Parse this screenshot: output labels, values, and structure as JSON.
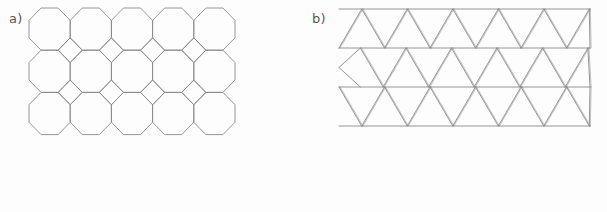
{
  "figure": {
    "background_color": "#fdfdfd",
    "stroke_color": "#8a8a8c",
    "stroke_width": 0.9,
    "width": 607,
    "height": 212
  },
  "panels": [
    {
      "id": "panel-a",
      "label": "a)",
      "label_position": {
        "x": 9,
        "y": 12
      },
      "tiling_name": "truncated square tiling",
      "tile_shapes": [
        "octagon",
        "square"
      ],
      "grid": {
        "columns": 5,
        "rows": 3,
        "pitch_x": 41.2,
        "pitch_y": 42.2,
        "origin_x": 29,
        "origin_y": 8
      },
      "bounds": {
        "x": 29,
        "y": 8,
        "width": 206,
        "height": 127
      },
      "octagon": {
        "side_fraction": 0.4142,
        "count": 15
      },
      "square_gaps": {
        "count": 8,
        "orientation": "diamond"
      }
    },
    {
      "id": "panel-b",
      "label": "b)",
      "label_position": {
        "x": 312,
        "y": 12
      },
      "tiling_name": "triangular tiling",
      "tile_shapes": [
        "triangle"
      ],
      "grid": {
        "columns": 6,
        "rows": 3,
        "pitch_x": 45.5,
        "row_height": 39,
        "origin_x": 339,
        "origin_y": 9
      },
      "bounds": {
        "x": 339,
        "y": 9,
        "width": 251,
        "height": 117
      },
      "horizontal_lines_y": [
        9,
        48,
        87,
        126
      ],
      "line_style": "double-stroke on diagonals"
    }
  ],
  "chart_data": {
    "type": "diagram",
    "title": "",
    "figures": [
      {
        "label": "a)",
        "description": "Octagonal (truncated square) tiling: 5 columns by 3 rows of regular octagons with small square gaps",
        "tile_counts": {
          "octagon": 15,
          "square": 8
        }
      },
      {
        "label": "b)",
        "description": "Triangular tiling: rows of alternating upward and downward equilateral triangles, 3 rows across 6 columns",
        "tile_counts": {
          "triangle": 36
        }
      }
    ]
  }
}
